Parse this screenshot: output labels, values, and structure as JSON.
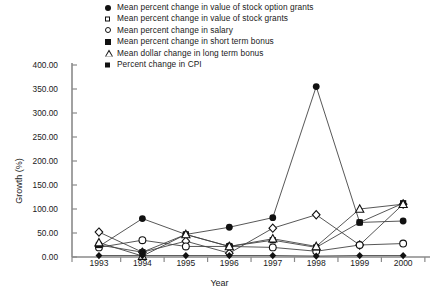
{
  "chart_data": {
    "type": "line",
    "title": "",
    "xlabel": "Year",
    "ylabel": "Growth (%)",
    "categories": [
      "1993",
      "1994",
      "1995",
      "1996",
      "1997",
      "1998",
      "1999",
      "2000"
    ],
    "x": [
      1993,
      1994,
      1995,
      1996,
      1997,
      1998,
      1999,
      2000
    ],
    "ylim": [
      0,
      400
    ],
    "ytick_labels": [
      "0.00",
      "50.00",
      "100.00",
      "150.00",
      "200.00",
      "250.00",
      "300.00",
      "350.00",
      "400.00"
    ],
    "ytick_values": [
      0,
      50,
      100,
      150,
      200,
      250,
      300,
      350,
      400
    ],
    "ytick_step": 50,
    "grid": false,
    "legend_position": "top",
    "series": [
      {
        "name": "Mean percent change in value of stock option grants",
        "marker": "filled-circle",
        "values": [
          22,
          80,
          47,
          62,
          82,
          355,
          72,
          75
        ]
      },
      {
        "name": "Mean percent change in value of stock grants",
        "marker": "open-diamond",
        "values": [
          52,
          10,
          33,
          8,
          60,
          88,
          25,
          110
        ]
      },
      {
        "name": "Mean percent change in salary",
        "marker": "open-circle",
        "values": [
          20,
          35,
          22,
          22,
          20,
          12,
          25,
          28
        ]
      },
      {
        "name": "Mean percent change in short term bonus",
        "marker": "filled-square",
        "values": [
          25,
          10,
          47,
          22,
          35,
          20,
          72,
          112
        ]
      },
      {
        "name": "Mean dollar change in long term bonus",
        "marker": "open-triangle",
        "values": [
          30,
          2,
          47,
          22,
          38,
          22,
          100,
          110
        ]
      },
      {
        "name": "Percent change in CPI",
        "marker": "filled-diamond",
        "values": [
          3,
          3,
          3,
          3,
          3,
          2,
          3,
          3
        ]
      }
    ]
  }
}
